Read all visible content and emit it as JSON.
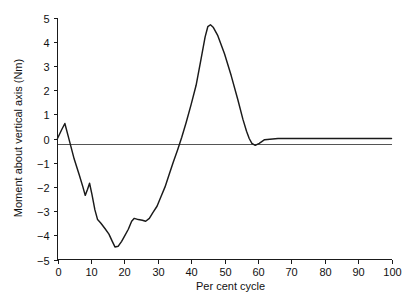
{
  "chart_data": {
    "type": "line",
    "title": "",
    "subtitle": "",
    "xlabel": "Per cent cycle",
    "ylabel": "Moment about vertical axis (Nm)",
    "xlim": [
      0,
      100
    ],
    "ylim": [
      -5,
      5
    ],
    "xticks": [
      0,
      10,
      20,
      30,
      40,
      50,
      60,
      70,
      80,
      90,
      100
    ],
    "xtick_labels": [
      "0",
      "10",
      "20",
      "30",
      "40",
      "50",
      "60",
      "70",
      "80",
      "90",
      "100"
    ],
    "yticks": [
      -5,
      -4,
      -3,
      -2,
      -1,
      0,
      1,
      2,
      3,
      4,
      5
    ],
    "ytick_labels": [
      "-5",
      "-4",
      "-3",
      "-2",
      "-1",
      "0",
      "1",
      "2",
      "3",
      "4",
      "5"
    ],
    "grid": false,
    "legend": null,
    "legend_position": "none",
    "zero_reference_line": true,
    "series": [
      {
        "name": "Moment about vertical axis",
        "color": "#1a1a1a",
        "x": [
          0,
          1.2,
          2.2,
          3.2,
          5.0,
          6.5,
          7.6,
          8.3,
          9.0,
          9.6,
          10.3,
          11.2,
          12.0,
          13.0,
          14.2,
          15.4,
          16.4,
          17.2,
          18.2,
          19.2,
          20.2,
          21.2,
          22.2,
          23.0,
          24.2,
          25.4,
          26.4,
          27.5,
          28.6,
          29.8,
          31.0,
          32.2,
          33.4,
          34.6,
          36.0,
          37.2,
          38.5,
          40.0,
          41.5,
          43.0,
          44.2,
          45.0,
          45.8,
          46.6,
          48.0,
          50.0,
          52.0,
          54.0,
          55.5,
          56.6,
          57.4,
          58.2,
          59.2,
          60.4,
          62.0,
          66.0,
          72.0,
          80.0,
          90.0,
          100.0
        ],
        "y": [
          0.0,
          0.35,
          0.62,
          0.1,
          -0.85,
          -1.5,
          -2.0,
          -2.35,
          -2.1,
          -1.85,
          -2.3,
          -2.95,
          -3.35,
          -3.5,
          -3.72,
          -3.95,
          -4.25,
          -4.48,
          -4.45,
          -4.25,
          -4.0,
          -3.75,
          -3.42,
          -3.3,
          -3.35,
          -3.38,
          -3.42,
          -3.3,
          -3.05,
          -2.8,
          -2.4,
          -2.0,
          -1.5,
          -1.0,
          -0.45,
          0.05,
          0.65,
          1.4,
          2.2,
          3.3,
          4.2,
          4.62,
          4.7,
          4.6,
          4.25,
          3.5,
          2.6,
          1.6,
          0.8,
          0.3,
          0.0,
          -0.2,
          -0.28,
          -0.2,
          -0.05,
          0.0,
          0.0,
          0.0,
          0.0,
          0.0
        ]
      }
    ],
    "annotations": []
  },
  "axes": {
    "y_axis_title": "Moment about vertical axis (Nm)",
    "x_axis_title": "Per cent cycle"
  }
}
